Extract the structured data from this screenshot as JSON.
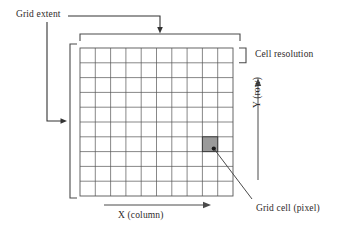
{
  "figure": {
    "type": "raster-grid-schematic",
    "background_color": "#ffffff",
    "line_color": "#4a4a4a",
    "text_color": "#2e2a2a"
  },
  "labels": {
    "grid_extent": "Grid extent",
    "cell_resolution": "Cell resolution",
    "grid_cell": "Grid cell (pixel)",
    "x_axis": "X (column)",
    "y_axis": "Y (row)"
  },
  "grid": {
    "columns": 10,
    "rows": 10,
    "cell_fill_color": "#9a9a9a",
    "cell_border_color": "#555555",
    "highlighted_cell": {
      "column": 9,
      "row": 7
    }
  },
  "annotations": {
    "grid_extent_bracket_top": "top bracket spanning full grid width",
    "grid_extent_bracket_left": "left bracket spanning full grid height",
    "cell_resolution_bracket": "bracket spanning one cell height",
    "x_axis_arrow_direction": "right",
    "y_axis_arrow_direction": "up",
    "grid_cell_leader": "diagonal leader line to shaded cell"
  }
}
